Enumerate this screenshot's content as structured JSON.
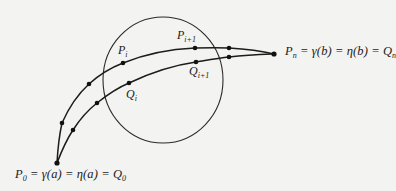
{
  "diagram": {
    "labels": {
      "start": {
        "main": "P",
        "sub": "0",
        "rest": " = γ(a) = η(a) = Q",
        "sub2": "0"
      },
      "end": {
        "main": "P",
        "sub": "n",
        "rest": " = γ(b) = η(b) = Q",
        "sub2": "n"
      },
      "p_i": {
        "main": "P",
        "sub": "i"
      },
      "p_i1": {
        "main": "P",
        "sub": "i+1"
      },
      "q_i": {
        "main": "Q",
        "sub": "i"
      },
      "q_i1": {
        "main": "Q",
        "sub": "i+1"
      }
    },
    "colors": {
      "ink": "#1c1c1c",
      "background": "#f3f3f1"
    },
    "curves": {
      "gamma_points": [
        [
          57,
          163
        ],
        [
          62,
          123
        ],
        [
          89,
          84
        ],
        [
          123,
          63
        ],
        [
          195,
          48
        ],
        [
          229,
          48
        ],
        [
          274,
          54
        ]
      ],
      "eta_points": [
        [
          57,
          163
        ],
        [
          73,
          130
        ],
        [
          97,
          103
        ],
        [
          129,
          83
        ],
        [
          196,
          62
        ],
        [
          229,
          57
        ],
        [
          274,
          54
        ]
      ]
    },
    "circle": {
      "cx": 163,
      "cy": 80,
      "rx": 60,
      "ry": 63
    }
  }
}
